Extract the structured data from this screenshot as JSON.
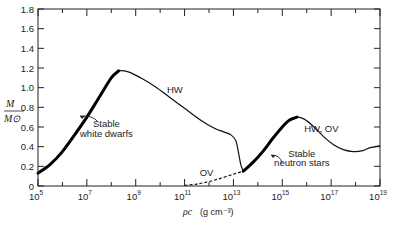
{
  "chart_data": {
    "type": "line",
    "title": "",
    "xlabel": "ρc (g cm⁻³)",
    "ylabel": "M/M⊙",
    "xscale": "log",
    "xlim": [
      100000.0,
      1e+19
    ],
    "ylim": [
      0,
      1.8
    ],
    "grid": false,
    "legend": null,
    "x_tick_labels": [
      "10^5",
      "10^7",
      "10^9",
      "10^11",
      "10^13",
      "10^15",
      "10^17",
      "10^19"
    ],
    "y_tick_labels": [
      "0",
      "0.2",
      "0.4",
      "0.6",
      "0.8",
      "1.0",
      "1.2",
      "1.4",
      "1.6",
      "1.8"
    ],
    "series": [
      {
        "name": "HW",
        "style": "solid",
        "log10_rho": [
          5.0,
          5.5,
          6.0,
          6.5,
          7.0,
          7.5,
          8.0,
          8.3,
          8.7,
          9.2,
          9.8,
          10.4,
          11.0,
          11.6,
          12.2,
          12.6,
          12.9,
          13.1,
          13.2,
          13.3,
          13.4
        ],
        "M": [
          0.13,
          0.22,
          0.35,
          0.52,
          0.7,
          0.9,
          1.1,
          1.17,
          1.16,
          1.1,
          1.01,
          0.9,
          0.79,
          0.68,
          0.59,
          0.55,
          0.52,
          0.46,
          0.35,
          0.22,
          0.15
        ]
      },
      {
        "name": "HW, OV",
        "style": "solid",
        "log10_rho": [
          13.4,
          13.8,
          14.2,
          14.6,
          15.0,
          15.3,
          15.6,
          15.9,
          16.3,
          16.7,
          17.1,
          17.5,
          17.9,
          18.3,
          18.6,
          19.0
        ],
        "M": [
          0.15,
          0.24,
          0.35,
          0.48,
          0.6,
          0.67,
          0.7,
          0.68,
          0.6,
          0.5,
          0.42,
          0.37,
          0.35,
          0.36,
          0.39,
          0.41
        ]
      },
      {
        "name": "OV",
        "style": "dashed",
        "log10_rho": [
          11.0,
          11.5,
          12.0,
          12.5,
          13.0,
          13.4
        ],
        "M": [
          0.005,
          0.02,
          0.045,
          0.08,
          0.12,
          0.15
        ]
      }
    ],
    "stable_branches": [
      {
        "label": "Stable white dwarfs",
        "log10_rho_range": [
          5.0,
          8.3
        ]
      },
      {
        "label": "Stable neutron stars",
        "log10_rho_range": [
          13.4,
          15.6
        ]
      }
    ],
    "annotations": [
      {
        "text": "HW",
        "log10_rho": 10.6,
        "M": 0.95
      },
      {
        "text": "OV",
        "log10_rho": 11.9,
        "M": 0.1
      },
      {
        "text": "HW, OV",
        "log10_rho": 16.6,
        "M": 0.55
      },
      {
        "text": "Stable",
        "log10_rho": 7.8,
        "M": 0.6
      },
      {
        "text": "white dwarfs",
        "log10_rho": 7.8,
        "M": 0.5
      },
      {
        "text": "Stable",
        "log10_rho": 15.8,
        "M": 0.3
      },
      {
        "text": "neutron stars",
        "log10_rho": 15.8,
        "M": 0.2
      }
    ]
  },
  "labels": {
    "ylabel_num": "M",
    "ylabel_den": "M⊙",
    "xlabel_rho": "ρc",
    "xlabel_units": "(g cm⁻³)"
  }
}
